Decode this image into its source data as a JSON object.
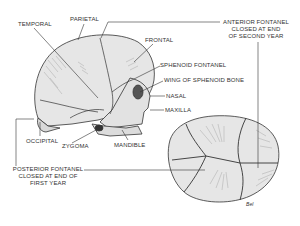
{
  "figure": {
    "lateral_view_labels": {
      "temporal": "TEMPORAL",
      "parietal": "PARIETAL",
      "frontal": "FRONTAL",
      "sphenoid_fontanel": "SPHENOID FONTANEL",
      "wing_of_sphenoid": "WING OF SPHENOID BONE",
      "nasal": "NASAL",
      "maxilla": "MAXILLA",
      "occipital": "OCCIPITAL",
      "zygoma": "ZYGOMA",
      "mandible": "MANDIBLE"
    },
    "fontanel_labels": {
      "anterior": [
        "ANTERIOR FONTANEL",
        "CLOSED AT END",
        "OF SECOND YEAR"
      ],
      "posterior": [
        "POSTERIOR FONTANEL",
        "CLOSED AT END OF",
        "FIRST YEAR"
      ]
    },
    "signature": "Bel",
    "colors": {
      "line": "#333333",
      "bone_fill": "#e6e6e6",
      "shade": "#9a9a9a",
      "background": "#ffffff"
    }
  }
}
